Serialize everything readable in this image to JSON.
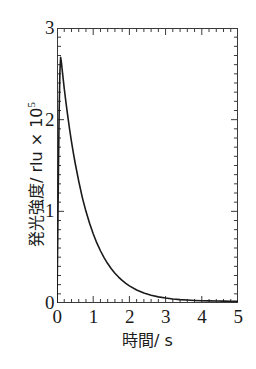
{
  "chart_data": {
    "type": "line",
    "title": "",
    "xlabel": "時間/ s",
    "ylabel": "発光強度/ rlu × 10",
    "ylabel_exponent": "5",
    "xlim": [
      0,
      5
    ],
    "ylim": [
      0,
      3
    ],
    "xticks": [
      0,
      1,
      2,
      3,
      4,
      5
    ],
    "yticks": [
      0,
      1,
      2,
      3
    ],
    "xtick_labels": [
      "0",
      "1",
      "2",
      "3",
      "4",
      "5"
    ],
    "ytick_labels": [
      "0",
      "1",
      "2",
      "3"
    ],
    "x_minor_tick_interval": 0.2,
    "y_minor_tick_interval": 0.1,
    "grid": false,
    "legend": null,
    "series": [
      {
        "name": "luminescence decay",
        "color": "#1a1a1a",
        "line_width": 1.6,
        "x": [
          0.0,
          0.02,
          0.04,
          0.06,
          0.08,
          0.1,
          0.12,
          0.15,
          0.2,
          0.25,
          0.3,
          0.35,
          0.4,
          0.45,
          0.5,
          0.6,
          0.7,
          0.8,
          0.9,
          1.0,
          1.1,
          1.2,
          1.3,
          1.4,
          1.5,
          1.6,
          1.7,
          1.8,
          1.9,
          2.0,
          2.2,
          2.4,
          2.6,
          2.8,
          3.0,
          3.2,
          3.4,
          3.6,
          3.8,
          4.0,
          4.2,
          4.4,
          4.6,
          4.8,
          5.0
        ],
        "y": [
          0.0,
          0.7,
          1.45,
          2.1,
          2.52,
          2.68,
          2.63,
          2.52,
          2.34,
          2.18,
          2.03,
          1.89,
          1.76,
          1.64,
          1.53,
          1.33,
          1.15,
          1.0,
          0.87,
          0.755,
          0.655,
          0.57,
          0.495,
          0.43,
          0.374,
          0.325,
          0.283,
          0.246,
          0.214,
          0.187,
          0.142,
          0.109,
          0.085,
          0.067,
          0.054,
          0.044,
          0.037,
          0.032,
          0.028,
          0.025,
          0.023,
          0.021,
          0.02,
          0.019,
          0.018
        ]
      }
    ],
    "peak": {
      "x": 0.1,
      "y": 2.68
    }
  },
  "axes": {
    "y_title_main": "発光強度/ rlu × 10",
    "y_title_sup": "5",
    "x_title": "時間/ s"
  }
}
